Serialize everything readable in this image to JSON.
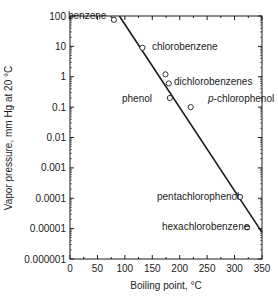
{
  "chart_data": {
    "type": "scatter",
    "title": "",
    "xlabel": "Boiling point, °C",
    "ylabel": "Vapor pressure, mm Hg at 20 °C",
    "xlim": [
      0,
      350
    ],
    "ylim": [
      1e-06,
      100
    ],
    "yscale": "log",
    "grid": false,
    "legend": "none",
    "x_ticks": [
      0,
      50,
      100,
      150,
      200,
      250,
      300,
      350
    ],
    "x_tick_labels": [
      "0",
      "50",
      "100",
      "150",
      "200",
      "250",
      "300",
      "350"
    ],
    "y_ticks": [
      100,
      10,
      1,
      0.1,
      0.01,
      0.001,
      0.0001,
      1e-05,
      1e-06
    ],
    "y_tick_labels": [
      "100",
      "10",
      "1",
      "0.1",
      "0.01",
      "0.001",
      "0.0001",
      "0.00001",
      "0.000001"
    ],
    "points": [
      {
        "label": "benzene",
        "x": 80,
        "y": 75
      },
      {
        "label": "chlorobenzene",
        "x": 132,
        "y": 9
      },
      {
        "label": "dichlorobenzenes",
        "x": 174,
        "y": 1.2
      },
      {
        "label": "dichlorobenzenes",
        "x": 180,
        "y": 0.6
      },
      {
        "label": "phenol",
        "x": 182,
        "y": 0.2
      },
      {
        "label": "p-chlorophenol",
        "x": 220,
        "y": 0.1
      },
      {
        "label": "pentachlorophenol",
        "x": 310,
        "y": 0.00011
      },
      {
        "label": "hexachlorobenzene",
        "x": 323,
        "y": 1.1e-05
      }
    ],
    "fit_line": {
      "x": [
        90,
        350
      ],
      "y": [
        100,
        7.5e-06
      ]
    },
    "point_labels": [
      {
        "text": "benzene",
        "x": 68,
        "y": 19,
        "italic_prefix": ""
      },
      {
        "text": "chlorobenzene",
        "x": 152,
        "y": 50,
        "italic_prefix": ""
      },
      {
        "text": "dichlorobenzenes",
        "x": 174,
        "y": 85,
        "italic_prefix": ""
      },
      {
        "text": "phenol",
        "x": 122,
        "y": 102,
        "italic_prefix": ""
      },
      {
        "text": "-chlorophenol",
        "x": 208,
        "y": 102,
        "italic_prefix": "p"
      },
      {
        "text": "pentachlorophenol",
        "x": 157,
        "y": 200,
        "italic_prefix": ""
      },
      {
        "text": "hexachlorobenzene",
        "x": 162,
        "y": 230,
        "italic_prefix": ""
      }
    ]
  }
}
